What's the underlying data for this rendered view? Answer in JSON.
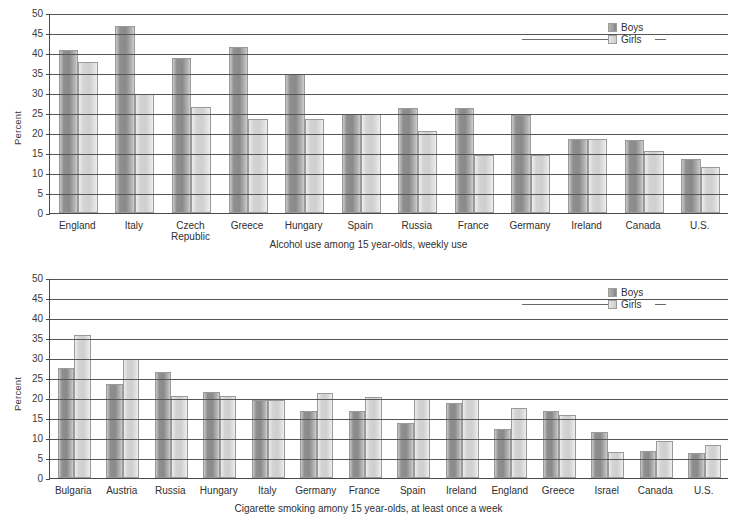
{
  "legend": {
    "boys_label": "Boys",
    "girls_label": "Girls",
    "boys_color": "#8f8f8f",
    "girls_color": "#d6d6d6"
  },
  "axis": {
    "ylabel": "Percent",
    "ticks": [
      "50",
      "45",
      "40",
      "35",
      "30",
      "25",
      "20",
      "15",
      "10",
      "5",
      "0"
    ]
  },
  "chart_data": [
    {
      "type": "bar",
      "id": "alcohol",
      "title": "Alcohol use among 15 year-olds, weekly use",
      "xlabel": "",
      "ylabel": "Percent",
      "ylim": [
        0,
        50
      ],
      "ytick_step": 5,
      "grid": true,
      "legend_position": "top-right",
      "categories": [
        "England",
        "Italy",
        "Czech\nRepublic",
        "Greece",
        "Hungary",
        "Spain",
        "Russia",
        "France",
        "Germany",
        "Ireland",
        "Canada",
        "U.S."
      ],
      "series": [
        {
          "name": "Boys",
          "values": [
            40.7,
            46.8,
            38.8,
            41.6,
            34.7,
            24.8,
            26.3,
            26.3,
            24.6,
            18.4,
            18.3,
            13.6
          ]
        },
        {
          "name": "Girls",
          "values": [
            37.8,
            29.8,
            26.6,
            23.6,
            23.6,
            24.8,
            20.5,
            14.6,
            14.5,
            18.4,
            15.6,
            11.5
          ]
        }
      ]
    },
    {
      "type": "bar",
      "id": "cigarette",
      "title": "Cigarette smoking amony 15 year-olds, at least once a week",
      "xlabel": "",
      "ylabel": "Percent",
      "ylim": [
        0,
        50
      ],
      "ytick_step": 5,
      "grid": true,
      "legend_position": "top-right",
      "categories": [
        "Bulgaria",
        "Austria",
        "Russia",
        "Hungary",
        "Italy",
        "Germany",
        "France",
        "Spain",
        "Ireland",
        "England",
        "Greece",
        "Israel",
        "Canada",
        "U.S."
      ],
      "series": [
        {
          "name": "Boys",
          "values": [
            27.6,
            23.5,
            26.5,
            21.4,
            19.6,
            16.7,
            16.7,
            13.8,
            18.8,
            12.3,
            16.8,
            11.4,
            6.8,
            6.2
          ]
        },
        {
          "name": "Girls",
          "values": [
            35.8,
            29.7,
            20.5,
            20.4,
            19.6,
            21.3,
            20.3,
            19.8,
            19.8,
            17.5,
            15.7,
            6.4,
            9.2,
            8.3
          ]
        }
      ]
    }
  ]
}
